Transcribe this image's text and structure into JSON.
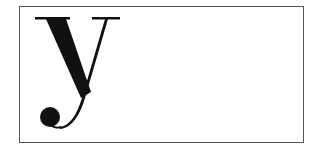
{
  "specimen": {
    "letter": "y",
    "ink_color": "#111111",
    "frame_color": "#555555"
  }
}
